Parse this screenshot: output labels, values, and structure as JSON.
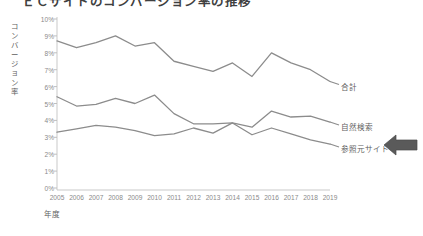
{
  "chart_data": {
    "type": "line",
    "title": "ＥＣサイトのコンバージョン率の推移",
    "xlabel": "年度",
    "ylabel": "コンバージョン率",
    "categories": [
      "2005",
      "2006",
      "2007",
      "2008",
      "2009",
      "2010",
      "2011",
      "2012",
      "2013",
      "2014",
      "2015",
      "2016",
      "2017",
      "2018",
      "2019"
    ],
    "x": [
      2005,
      2006,
      2007,
      2008,
      2009,
      2010,
      2011,
      2012,
      2013,
      2014,
      2015,
      2016,
      2017,
      2018,
      2019
    ],
    "ylim": [
      0,
      10
    ],
    "ytick_labels": [
      "10%",
      "9%",
      "8%",
      "7%",
      "6%",
      "5%",
      "4%",
      "3%",
      "2%",
      "1%",
      "0%"
    ],
    "ytick_values": [
      10,
      9,
      8,
      7,
      6,
      5,
      4,
      3,
      2,
      1,
      0
    ],
    "grid": false,
    "legend": "series end labels at right",
    "series": [
      {
        "name": "合計",
        "color": "#8c8c8c",
        "values": [
          8.7,
          8.3,
          8.6,
          9.0,
          8.4,
          8.6,
          7.5,
          7.2,
          6.9,
          7.4,
          6.6,
          8.0,
          7.4,
          7.0,
          6.3
        ]
      },
      {
        "name": "自然検索",
        "color": "#8c8c8c",
        "values": [
          5.4,
          4.85,
          4.95,
          5.3,
          5.0,
          5.5,
          4.4,
          3.8,
          3.8,
          3.85,
          3.6,
          4.55,
          4.2,
          4.25,
          3.9
        ]
      },
      {
        "name": "参照元サイト",
        "color": "#8c8c8c",
        "values": [
          3.3,
          3.5,
          3.7,
          3.6,
          3.4,
          3.1,
          3.2,
          3.55,
          3.25,
          3.85,
          3.15,
          3.55,
          3.2,
          2.85,
          2.6
        ]
      }
    ],
    "annotation": {
      "name": "arrow-pointing-left",
      "target_series": "参照元サイト",
      "color": "#5a5a5a"
    }
  },
  "axis": {
    "axis_color": "#bfbfbf",
    "tick_color": "#8a8a8a"
  }
}
